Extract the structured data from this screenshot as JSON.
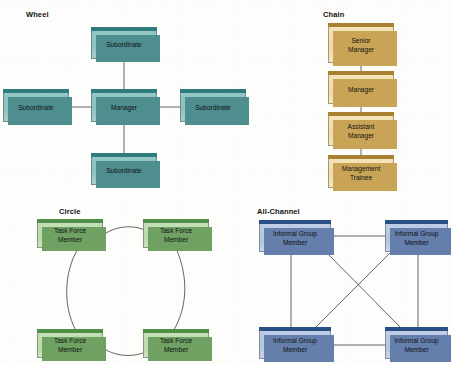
{
  "figure": {
    "width": 453,
    "height": 365,
    "background_color": "#fdfdfc",
    "line_color": "#3d3d3d"
  },
  "sections": [
    {
      "key": "wheel",
      "label": "Wheel",
      "box_fill": "#8fc4c3",
      "box_band": "#2f7a7c",
      "box_shadow": "#4e8e8e",
      "nodes": [
        {
          "name": "wheel-top",
          "text": "Subordinate"
        },
        {
          "name": "wheel-left",
          "text": "Subordinate"
        },
        {
          "name": "wheel-center",
          "text": "Manager"
        },
        {
          "name": "wheel-right",
          "text": "Subordinate"
        },
        {
          "name": "wheel-bottom",
          "text": "Subordinate"
        }
      ]
    },
    {
      "key": "chain",
      "label": "Chain",
      "box_fill": "#f2dfb0",
      "box_band": "#a9802f",
      "box_shadow": "#c9a457",
      "nodes": [
        {
          "name": "chain-1",
          "text": "Senior\nManager"
        },
        {
          "name": "chain-2",
          "text": "Manager"
        },
        {
          "name": "chain-3",
          "text": "Assistant\nManager"
        },
        {
          "name": "chain-4",
          "text": "Management\nTrainee"
        }
      ]
    },
    {
      "key": "circle",
      "label": "Circle",
      "box_fill": "#bedcb1",
      "box_band": "#4f8f47",
      "box_shadow": "#6ea162",
      "nodes": [
        {
          "name": "circle-top-left",
          "text": "Task Force\nMember"
        },
        {
          "name": "circle-top-right",
          "text": "Task Force\nMember"
        },
        {
          "name": "circle-bottom-left",
          "text": "Task Force\nMember"
        },
        {
          "name": "circle-bottom-right",
          "text": "Task Force\nMember"
        }
      ]
    },
    {
      "key": "all_channel",
      "label": "All-Channel",
      "box_fill": "#b9c9e2",
      "box_band": "#2a4f86",
      "box_shadow": "#657fad",
      "nodes": [
        {
          "name": "all-channel-top-left",
          "text": "Informal Group\nMember"
        },
        {
          "name": "all-channel-top-right",
          "text": "Informal Group\nMember"
        },
        {
          "name": "all-channel-bottom-left",
          "text": "Informal Group\nMember"
        },
        {
          "name": "all-channel-bottom-right",
          "text": "Informal Group\nMember"
        }
      ]
    }
  ]
}
